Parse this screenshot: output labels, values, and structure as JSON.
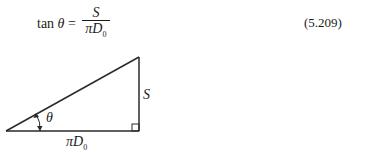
{
  "equation": {
    "lhs_func": "tan",
    "lhs_var": "θ",
    "equals": "=",
    "numerator": "S",
    "denominator_pi": "π",
    "denominator_var": "D",
    "denominator_sub": "0",
    "number": "(5.209)"
  },
  "diagram": {
    "type": "right-triangle",
    "angle_label": "θ",
    "vertical_side_label": "S",
    "horizontal_side_label_pi": "π",
    "horizontal_side_label_var": "D",
    "horizontal_side_label_sub": "0",
    "stroke_color": "#2a2a2a"
  }
}
